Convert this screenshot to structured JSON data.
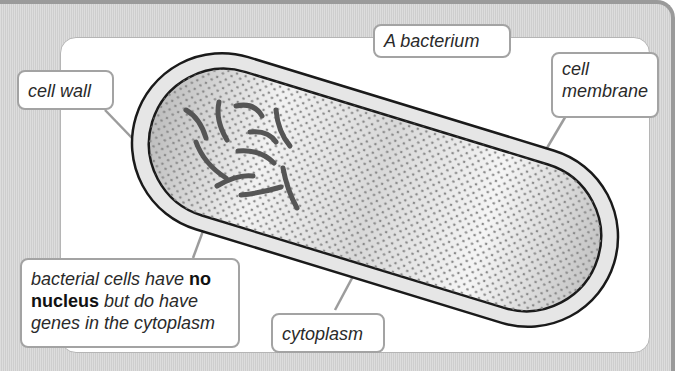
{
  "diagram": {
    "title": "A bacterium",
    "labels": {
      "cell_wall": "cell wall",
      "cell_membrane_line1": "cell",
      "cell_membrane_line2": "membrane",
      "cytoplasm": "cytoplasm",
      "nucleus_note": {
        "part1": "bacterial cells have ",
        "bold1": "no",
        "bold2": "nucleus",
        "part2": " but do have",
        "line3": "genes in the cytoplasm"
      }
    },
    "structures": [
      "cell wall",
      "cell membrane",
      "cytoplasm",
      "genes"
    ],
    "colors": {
      "frame": "#d6d6d6",
      "frame_edge": "#9a9a9a",
      "label_border": "#a3a3a3",
      "cell_wall_fill": "#e6e6e6",
      "outline": "#1a1a1a",
      "genes": "#555555",
      "leader_line": "#9c9c9c"
    }
  }
}
